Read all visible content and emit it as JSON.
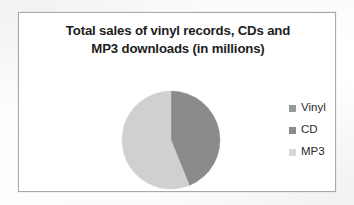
{
  "chart_data": {
    "type": "pie",
    "title": "Total sales of vinyl records, CDs and MP3 downloads (in millions)",
    "title_lines": [
      "Total sales of vinyl records, CDs and",
      "MP3 downloads  (in millions)"
    ],
    "categories": [
      "Vinyl",
      "CD",
      "MP3"
    ],
    "values": [
      0,
      44,
      56
    ],
    "value_unit": "percent",
    "colors": [
      "#9a9a9a",
      "#8a8a8a",
      "#d0d0d0"
    ],
    "legend_position": "right",
    "grid": false,
    "xlabel": "",
    "ylabel": "",
    "slices": [
      {
        "label": "Vinyl",
        "value": 0,
        "color": "#9a9a9a",
        "start_angle_deg": 0,
        "end_angle_deg": 0
      },
      {
        "label": "CD",
        "value": 44,
        "color": "#8a8a8a",
        "start_angle_deg": 0,
        "end_angle_deg": 158
      },
      {
        "label": "MP3",
        "value": 56,
        "color": "#d0d0d0",
        "start_angle_deg": 158,
        "end_angle_deg": 360
      }
    ]
  },
  "legend": {
    "items": [
      {
        "label": "Vinyl",
        "color": "#9a9a9a"
      },
      {
        "label": "CD",
        "color": "#8a8a8a"
      },
      {
        "label": "MP3",
        "color": "#d7d7d7"
      }
    ]
  },
  "geometry": {
    "pie_center_x": 152,
    "pie_center_y": 79,
    "pie_radius": 49
  }
}
